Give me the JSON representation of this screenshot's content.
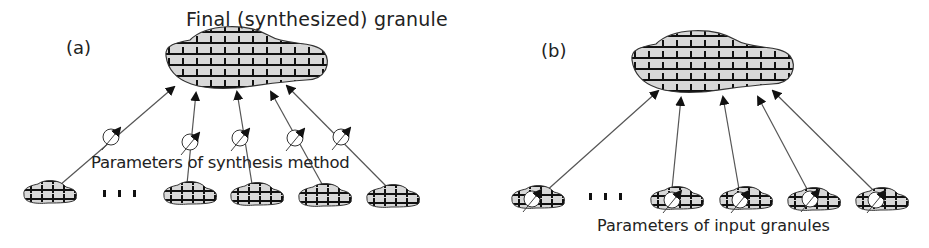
{
  "diagram": {
    "title": "Final (synthesized) granule",
    "panels": [
      {
        "id": "a",
        "label": "(a)",
        "caption": "Parameters of synthesis method",
        "target_granule": "final synthesized granule",
        "input_granule_count_shown": 5,
        "ellipsis": "...",
        "parameter_location": "on arrows (synthesis method)"
      },
      {
        "id": "b",
        "label": "(b)",
        "caption": "Parameters of input granules",
        "target_granule": "final synthesized granule",
        "input_granule_count_shown": 5,
        "ellipsis": "...",
        "parameter_location": "on input granules"
      }
    ],
    "colors": {
      "granule_fill": "#d8d8d8",
      "stroke": "#111111",
      "arrow": "#555555",
      "text": "#222222"
    }
  }
}
